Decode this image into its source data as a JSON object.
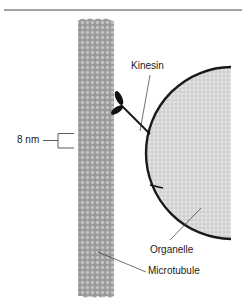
{
  "diagram": {
    "labels": {
      "kinesin": "Kinesin",
      "organelle": "Organelle",
      "microtubule": "Microtubule",
      "scale": "8 nm"
    },
    "colors": {
      "background": "#ffffff",
      "rule": "#444444",
      "microtubule_fill": "#9a9a9a",
      "microtubule_dot": "#c4c4c4",
      "organelle_fill": "#d2d2d2",
      "organelle_dot": "#e6e6e6",
      "organelle_membrane": "#1a1a1a",
      "kinesin": "#111111",
      "leader": "#333333",
      "text": "#222222"
    }
  }
}
